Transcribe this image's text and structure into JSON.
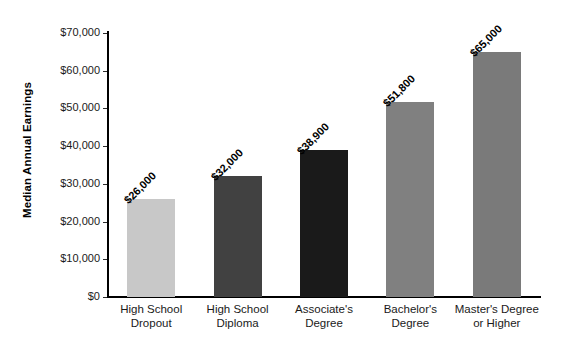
{
  "chart_data": {
    "type": "bar",
    "title": "",
    "xlabel": "",
    "ylabel": "Median Annual Earnings",
    "categories": [
      "High School\nDropout",
      "High School\nDiploma",
      "Associate's\nDegree",
      "Bachelor's\nDegree",
      "Master's Degree\nor Higher"
    ],
    "values": [
      26000,
      32000,
      38900,
      51800,
      65000
    ],
    "value_labels": [
      "$26,000",
      "$32,000",
      "$38,900",
      "$51,800",
      "$65,000"
    ],
    "bar_colors": [
      "#c8c8c8",
      "#414141",
      "#1a1a1a",
      "#808080",
      "#7a7a7a"
    ],
    "ylim": [
      0,
      70000
    ],
    "ytick_values": [
      0,
      10000,
      20000,
      30000,
      40000,
      50000,
      60000,
      70000
    ],
    "ytick_labels": [
      "$0",
      "$10,000",
      "$20,000",
      "$30,000",
      "$40,000",
      "$50,000",
      "$60,000",
      "$70,000"
    ],
    "grid": false,
    "legend": false
  }
}
